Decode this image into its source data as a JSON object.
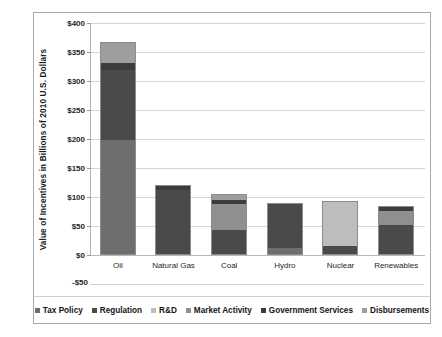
{
  "chart_data": {
    "type": "bar",
    "subtype": "stacked-column",
    "title": "",
    "xlabel": "",
    "ylabel": "Value of Incentives in Billions of 2010 U.S. Dollars",
    "ylim": [
      -50,
      400
    ],
    "ytick_labels": [
      "$400",
      "$350",
      "$300",
      "$250",
      "$200",
      "$150",
      "$100",
      "$50",
      "$0",
      "-$50"
    ],
    "ytick_values": [
      400,
      350,
      300,
      250,
      200,
      150,
      100,
      50,
      0,
      -50
    ],
    "grid": "horizontal",
    "legend_position": "bottom",
    "categories": [
      "Oil",
      "Natural Gas",
      "Coal",
      "Hydro",
      "Nuclear",
      "Renewables"
    ],
    "series": [
      {
        "name": "Tax Policy",
        "color": "#6e6e6e",
        "values": [
          200,
          0,
          0,
          13,
          0,
          0
        ]
      },
      {
        "name": "Regulation",
        "color": "#4a4a4a",
        "values": [
          120,
          113,
          45,
          77,
          18,
          53
        ]
      },
      {
        "name": "R&D",
        "color": "#bdbdbd",
        "values": [
          0,
          0,
          0,
          0,
          75,
          0
        ]
      },
      {
        "name": "Market Activity",
        "color": "#8f8f8f",
        "values": [
          0,
          0,
          45,
          0,
          0,
          25
        ]
      },
      {
        "name": "Government Services",
        "color": "#3c3c3c",
        "values": [
          13,
          7,
          7,
          0,
          0,
          6
        ]
      },
      {
        "name": "Disbursements",
        "color": "#9e9e9e",
        "values": [
          35,
          0,
          8,
          0,
          0,
          0
        ]
      }
    ],
    "totals": [
      368,
      120,
      105,
      90,
      93,
      84
    ]
  },
  "legend": {
    "items": [
      {
        "label": "Tax Policy",
        "color": "#6e6e6e"
      },
      {
        "label": "Regulation",
        "color": "#4a4a4a"
      },
      {
        "label": "R&D",
        "color": "#bdbdbd"
      },
      {
        "label": "Market Activity",
        "color": "#8f8f8f"
      },
      {
        "label": "Government Services",
        "color": "#3c3c3c"
      },
      {
        "label": "Disbursements",
        "color": "#9e9e9e"
      }
    ]
  }
}
